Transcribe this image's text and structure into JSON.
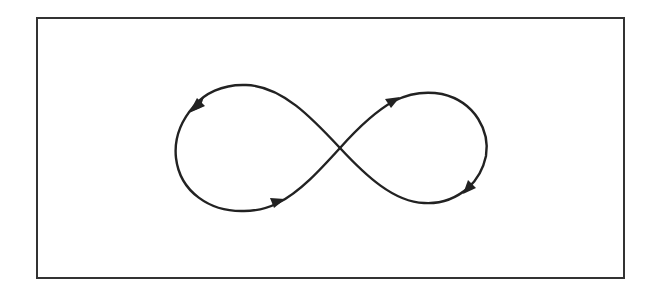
{
  "diagram": {
    "type": "lemniscate-flow",
    "colors": {
      "stroke": "#222222",
      "background": "#ffffff"
    },
    "frame": {
      "x": 36,
      "y": 17,
      "width": 589,
      "height": 262
    },
    "arrows": [
      {
        "loop": "left",
        "position": "top",
        "direction": "down-left"
      },
      {
        "loop": "left",
        "position": "bottom",
        "direction": "right"
      },
      {
        "loop": "right",
        "position": "top",
        "direction": "up-right"
      },
      {
        "loop": "right",
        "position": "bottom",
        "direction": "down-left"
      }
    ]
  }
}
